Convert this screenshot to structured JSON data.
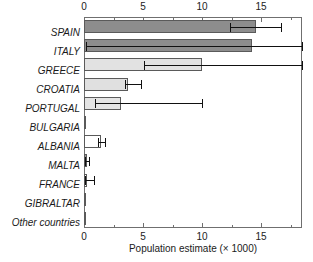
{
  "chart_data": {
    "type": "bar",
    "orientation": "horizontal",
    "title": "",
    "xlabel": "Population estimate (× 1000)",
    "ylabel": "",
    "xlim": [
      0,
      18.4
    ],
    "xticks": [
      0,
      5,
      10,
      15
    ],
    "xtick_labels": [
      "0",
      "5",
      "10",
      "15"
    ],
    "minor_ticks": [
      2.5,
      7.5,
      12.5,
      17.5
    ],
    "grid": false,
    "axis_top": true,
    "axis_bottom": true,
    "legend": "none",
    "categories": [
      "SPAIN",
      "ITALY",
      "GREECE",
      "CROATIA",
      "PORTUGAL",
      "BULGARIA",
      "ALBANIA",
      "MALTA",
      "FRANCE",
      "GIBRALTAR",
      "Other countries"
    ],
    "values": [
      14.5,
      14.2,
      10.0,
      3.7,
      3.1,
      0.05,
      1.4,
      0.28,
      0.22,
      0.03,
      0.03
    ],
    "error_low": [
      12.3,
      0.2,
      5.1,
      3.5,
      0.9,
      0.0,
      1.2,
      0.1,
      0.05,
      0.0,
      0.0
    ],
    "error_high": [
      16.6,
      18.4,
      18.4,
      4.8,
      10.0,
      0.05,
      1.8,
      0.45,
      0.85,
      0.03,
      0.03
    ],
    "bar_fills": [
      "#8d8d8d",
      "#8d8d8d",
      "#e2e2e2",
      "#e0e0e0",
      "#e4e4e4",
      "#5a5a5a",
      "#ffffff",
      "#9a9a9a",
      "#ffffff",
      "#5a5a5a",
      "#5a5a5a"
    ],
    "bar_edge_color": "#5a5a5a",
    "error_color": "#111111",
    "axis_color": "#6f6f6f",
    "background": "#ffffff"
  }
}
